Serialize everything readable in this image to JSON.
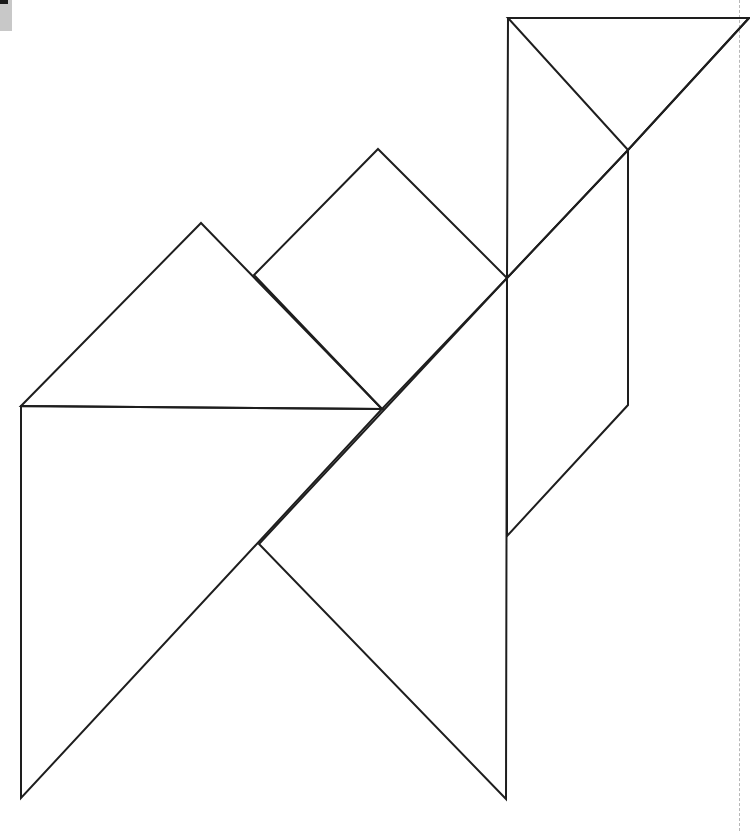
{
  "diagram": {
    "type": "tangram-outline",
    "stroke_color": "#1e1e1e",
    "background": "#ffffff",
    "pieces": [
      {
        "name": "large-triangle-top-right",
        "points": "508,18 749,18 628,150 507,278"
      },
      {
        "name": "small-triangle-top",
        "points": "508,18 749,18 628,150"
      },
      {
        "name": "parallelogram-right",
        "points": "628,150 628,405 507,536 507,278"
      },
      {
        "name": "square-middle",
        "points": "378,149 507,278 382,409 254,275"
      },
      {
        "name": "medium-triangle-left",
        "points": "21,406 201,223 382,409"
      },
      {
        "name": "large-triangle-left",
        "points": "21,406 382,409 21,798"
      },
      {
        "name": "large-triangle-bottom",
        "points": "507,278 506,799 259,544"
      }
    ]
  }
}
